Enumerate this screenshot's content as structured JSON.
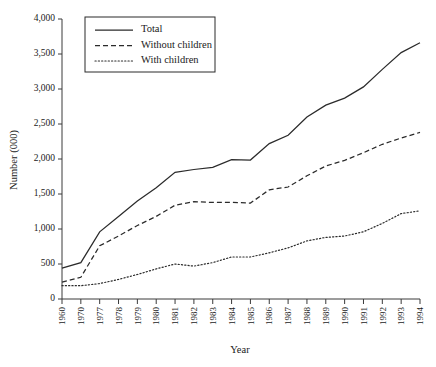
{
  "chart_data": {
    "type": "line",
    "title": "",
    "xlabel": "Year",
    "ylabel": "Number (000)",
    "ylim": [
      0,
      4000
    ],
    "ytick_labels": [
      "0",
      "500",
      "1,000",
      "1,500",
      "2,000",
      "2,500",
      "3,000",
      "3,500",
      "4,000"
    ],
    "ytick_values": [
      0,
      500,
      1000,
      1500,
      2000,
      2500,
      3000,
      3500,
      4000
    ],
    "grid": false,
    "legend_position": "top-left",
    "categories": [
      "1960",
      "1970",
      "1977",
      "1978",
      "1979",
      "1980",
      "1981",
      "1982",
      "1983",
      "1984",
      "1985",
      "1986",
      "1987",
      "1988",
      "1989",
      "1990",
      "1991",
      "1992",
      "1993",
      "1994"
    ],
    "series": [
      {
        "name": "Total",
        "style": "solid",
        "color": "#2b2b2b",
        "values": [
          440,
          520,
          960,
          1180,
          1400,
          1590,
          1810,
          1850,
          1880,
          1990,
          1985,
          2220,
          2340,
          2600,
          2770,
          2870,
          3030,
          3280,
          3520,
          3660
        ]
      },
      {
        "name": "Without children",
        "style": "dashed",
        "color": "#2b2b2b",
        "values": [
          240,
          310,
          760,
          900,
          1050,
          1180,
          1340,
          1390,
          1380,
          1380,
          1370,
          1560,
          1600,
          1760,
          1900,
          1980,
          2090,
          2210,
          2300,
          2380
        ]
      },
      {
        "name": "With children",
        "style": "dotted",
        "color": "#2b2b2b",
        "values": [
          190,
          190,
          220,
          280,
          350,
          430,
          500,
          470,
          520,
          600,
          600,
          660,
          730,
          830,
          880,
          900,
          960,
          1080,
          1220,
          1260
        ]
      }
    ]
  }
}
